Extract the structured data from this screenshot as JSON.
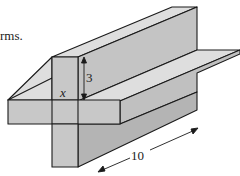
{
  "text_fragment": "rms.",
  "figure": {
    "type": "3D cross-shaped prism (two intersecting rectangular bars)",
    "labels": {
      "height": "3",
      "unknown": "x",
      "length": "10"
    },
    "colors": {
      "front": "#c8c8c8",
      "top": "#dedede",
      "side": "#b4b4b4",
      "stroke": "#1a1a1a"
    }
  }
}
